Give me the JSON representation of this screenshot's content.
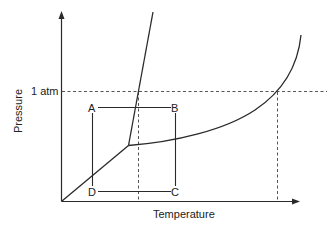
{
  "diagram": {
    "type": "phase-diagram",
    "x_axis_label": "Temperature",
    "y_axis_label": "Pressure",
    "reference_pressure_label": "1 atm",
    "points": [
      {
        "name": "A",
        "label": "A"
      },
      {
        "name": "B",
        "label": "B"
      },
      {
        "name": "C",
        "label": "C"
      },
      {
        "name": "D",
        "label": "D"
      }
    ],
    "colors": {
      "line": "#2a2a2a",
      "dashed": "#555555",
      "text": "#222222",
      "background": "#ffffff"
    }
  }
}
